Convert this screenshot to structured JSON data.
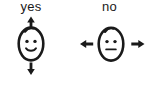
{
  "figure": {
    "background_color": "#ffffff",
    "ink_color": "#1a1a1a",
    "width": 149,
    "height": 85
  },
  "panels": [
    {
      "id": "yes",
      "label": "yes",
      "face": {
        "expression": "smiling",
        "mouth": "smile-curve",
        "eyes": 2,
        "hair": "single-curl-top-left",
        "shape": "egg"
      },
      "arrows": {
        "axis": "vertical",
        "directions": [
          "up",
          "down"
        ],
        "glyphs": [
          "↑",
          "↓"
        ],
        "meaning": "nod"
      }
    },
    {
      "id": "no",
      "label": "no",
      "face": {
        "expression": "neutral",
        "mouth": "straight-line",
        "eyes": 2,
        "hair": "single-curl-top-left",
        "shape": "egg"
      },
      "arrows": {
        "axis": "horizontal",
        "directions": [
          "left",
          "right"
        ],
        "glyphs": [
          "←",
          "→"
        ],
        "meaning": "shake"
      }
    }
  ]
}
